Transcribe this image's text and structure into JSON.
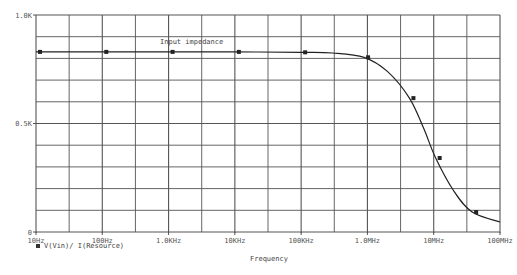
{
  "chart_data": {
    "type": "line",
    "title": "Input impedance",
    "xlabel": "Frequency",
    "ylabel": "",
    "xscale": "log",
    "xlim": [
      10,
      100000000
    ],
    "ylim": [
      0,
      1000
    ],
    "grid": true,
    "legend_position": "bottom-left",
    "x_tick_labels": [
      "10Hz",
      "100Hz",
      "1.0KHz",
      "10KHz",
      "100KHz",
      "1.0MHz",
      "10MHz",
      "100MHz"
    ],
    "y_tick_labels": [
      "0",
      "0.5K",
      "1.0K"
    ],
    "series": [
      {
        "name": "V(Vin)/ I(Resource)",
        "marker": "square",
        "x": [
          10,
          100,
          1000,
          10000,
          100000,
          300000,
          890000,
          2000000,
          4300000,
          7000000,
          10700000,
          20000000,
          38000000,
          100000000
        ],
        "y": [
          830,
          830,
          830,
          830,
          828,
          825,
          805,
          740,
          617,
          480,
          341,
          190,
          92,
          46
        ],
        "marker_points": [
          {
            "x": 10,
            "y": 830
          },
          {
            "x": 100,
            "y": 830
          },
          {
            "x": 1000,
            "y": 830
          },
          {
            "x": 10000,
            "y": 830
          },
          {
            "x": 100000,
            "y": 828
          },
          {
            "x": 890000,
            "y": 805
          },
          {
            "x": 4300000,
            "y": 617
          },
          {
            "x": 10700000,
            "y": 341
          },
          {
            "x": 38000000,
            "y": 92
          }
        ]
      }
    ]
  },
  "labels": {
    "annotation": "Input impedance",
    "legend": "V(Vin)/ I(Resource)",
    "xlabel": "Frequency"
  },
  "colors": {
    "grid": "#555555",
    "trace": "#222222",
    "text": "#555555"
  }
}
